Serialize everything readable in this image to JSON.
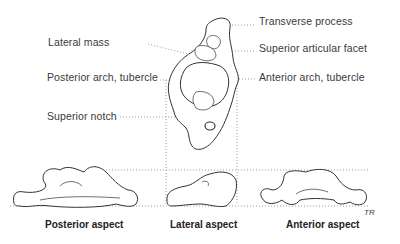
{
  "labels": {
    "left": [
      {
        "text": "Lateral mass",
        "x": 48,
        "y": 36
      },
      {
        "text": "Posterior arch, tubercle",
        "x": 47,
        "y": 71
      },
      {
        "text": "Superior notch",
        "x": 47,
        "y": 110
      }
    ],
    "right": [
      {
        "text": "Transverse process",
        "x": 259,
        "y": 15
      },
      {
        "text": "Superior articular facet",
        "x": 259,
        "y": 42
      },
      {
        "text": "Anterior arch, tubercle",
        "x": 259,
        "y": 71
      }
    ]
  },
  "captions": {
    "posterior": "Posterior aspect",
    "lateral": "Lateral aspect",
    "anterior": "Anterior aspect"
  },
  "signature": "TR",
  "colors": {
    "line": "#333333",
    "leader": "#777777",
    "text": "#3a3a3a"
  }
}
